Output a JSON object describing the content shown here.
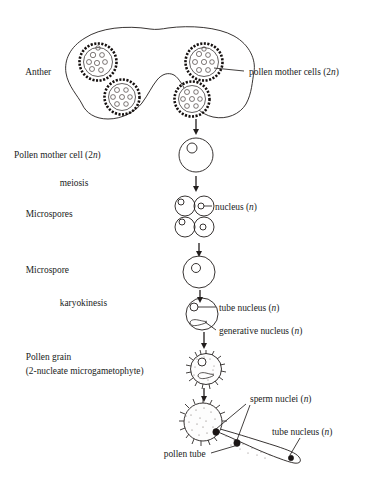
{
  "figure": {
    "stage_labels": [
      {
        "id": "anther",
        "text": "Anther",
        "x": 14,
        "y": 72
      },
      {
        "id": "pollen-mother-cell",
        "text": "Pollen mother cell (2",
        "italic": "n",
        "suffix": ")",
        "x": 14,
        "y": 158
      },
      {
        "id": "meiosis",
        "text": "meiosis",
        "x": 46,
        "y": 185
      },
      {
        "id": "microspores",
        "text": "Microspores",
        "x": 14,
        "y": 216
      },
      {
        "id": "microspore",
        "text": "Microspore",
        "x": 14,
        "y": 272
      },
      {
        "id": "karyokinesis",
        "text": "karyokinesis",
        "x": 46,
        "y": 304
      },
      {
        "id": "pollen-grain",
        "text": "Pollen grain",
        "x": 14,
        "y": 358
      },
      {
        "id": "pollen-grain-sub",
        "text": "(2-nucleate microgametophyte)",
        "x": 14,
        "y": 372
      }
    ],
    "callout_labels": [
      {
        "id": "pollen-mother-cells",
        "text": "pollen mother cells (2",
        "italic": "n",
        "suffix": ")",
        "x": 248,
        "y": 75
      },
      {
        "id": "nucleus",
        "text": "nucleus (",
        "italic": "n",
        "suffix": ")",
        "x": 214,
        "y": 210
      },
      {
        "id": "tube-nucleus-grain",
        "text": "tube nucleus (",
        "italic": "n",
        "suffix": ")",
        "x": 219,
        "y": 313
      },
      {
        "id": "generative-nucleus",
        "text": "generative nucleus (",
        "italic": "n",
        "suffix": ")",
        "x": 219,
        "y": 334
      },
      {
        "id": "sperm-nuclei",
        "text": "sperm nuclei (",
        "italic": "n",
        "suffix": ")",
        "x": 249,
        "y": 401
      },
      {
        "id": "tube-nucleus-tip",
        "text": "tube nucleus (",
        "italic": "n",
        "suffix": ")",
        "x": 271,
        "y": 434
      },
      {
        "id": "pollen-tube",
        "text": "pollen tube",
        "x": 151,
        "y": 456
      }
    ],
    "colors": {
      "ink": "#211d1c",
      "sac_wall": "#15100f",
      "stipple": "#6d6361",
      "background": "#ffffff"
    },
    "structures": {
      "anther": {
        "name": "anther-outline",
        "pollen_sac_count": 4,
        "pollen_sacs": [
          {
            "cx": 98,
            "cy": 62,
            "r": 20
          },
          {
            "cx": 204,
            "cy": 62,
            "r": 20
          },
          {
            "cx": 122,
            "cy": 97,
            "r": 19
          },
          {
            "cx": 192,
            "cy": 99,
            "r": 19
          }
        ]
      },
      "pollen_mother_cell": {
        "cx": 196,
        "cy": 155,
        "r": 17,
        "nucleus": {
          "cx": 192,
          "cy": 148,
          "r": 5
        }
      },
      "tetrad": {
        "count": 4,
        "cells": [
          {
            "cx": 185,
            "cy": 206,
            "r": 10,
            "nx": 181,
            "ny": 202,
            "nr": 3
          },
          {
            "cx": 204,
            "cy": 206,
            "r": 10,
            "nx": 201,
            "ny": 206,
            "nr": 3
          },
          {
            "cx": 185,
            "cy": 227,
            "r": 10,
            "nx": 182,
            "ny": 222,
            "nr": 3
          },
          {
            "cx": 204,
            "cy": 227,
            "r": 10,
            "nx": 203,
            "ny": 227,
            "nr": 3
          }
        ]
      },
      "microspore": {
        "cx": 199,
        "cy": 272,
        "r": 16,
        "nucleus": {
          "cx": 196,
          "cy": 268,
          "r": 4.5
        }
      },
      "binucleate_microspore": {
        "cx": 202,
        "cy": 314,
        "r": 16,
        "tube_nucleus": {
          "cx": 194,
          "cy": 307,
          "r": 4
        },
        "generative_nucleus": {
          "cx": 198,
          "cy": 322
        }
      },
      "pollen_grain": {
        "cx": 206,
        "cy": 369,
        "r": 17,
        "wall": "echinate",
        "tube_nucleus": {
          "cx": 202,
          "cy": 362,
          "r": 4
        },
        "generative_nucleus": {
          "cx": 206,
          "cy": 375
        }
      },
      "germinated_grain": {
        "cx": 203,
        "cy": 422,
        "r": 21,
        "tube_tip": {
          "x": 300,
          "y": 462
        },
        "sperm_nuclei": [
          {
            "cx": 216,
            "cy": 432
          },
          {
            "cx": 237,
            "cy": 443
          }
        ],
        "tip_nucleus": {
          "cx": 291,
          "cy": 458
        }
      }
    },
    "arrows": [
      {
        "id": "anther-to-pmc",
        "x": 196,
        "y1": 118,
        "y2": 133
      },
      {
        "id": "pmc-to-tetrad",
        "x": 196,
        "y1": 175,
        "y2": 190
      },
      {
        "id": "tetrad-to-microspore",
        "x": 199,
        "y1": 242,
        "y2": 254
      },
      {
        "id": "microspore-to-binucleate",
        "x": 200,
        "y1": 290,
        "y2": 300
      },
      {
        "id": "binucleate-to-grain",
        "x": 204,
        "y1": 332,
        "y2": 347
      },
      {
        "id": "grain-to-germinated",
        "x": 204,
        "y1": 388,
        "y2": 399
      }
    ]
  }
}
